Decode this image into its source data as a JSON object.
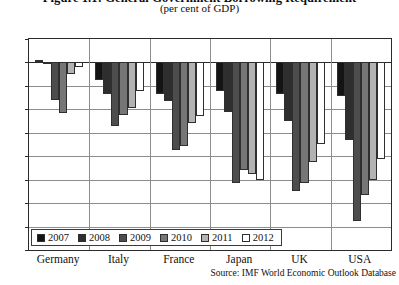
{
  "chart_data": {
    "type": "bar",
    "title": "Figure 1.1: General Government Borrowing Requirement",
    "subtitle": "(per cent of GDP)",
    "xlabel": "",
    "ylabel": "",
    "ylim": [
      -16,
      2
    ],
    "ytick_step": 2,
    "yticks": [
      2,
      0,
      -2,
      -4,
      -6,
      -8,
      -10,
      -12,
      -14,
      -16
    ],
    "ytick_labels": [
      "2",
      "0",
      "-2",
      "-4",
      "-6",
      "-8",
      "-10",
      "-12",
      "-14",
      "-16"
    ],
    "grid": true,
    "legend_position": "bottom-left-inside",
    "categories": [
      "Germany",
      "Italy",
      "France",
      "Japan",
      "UK",
      "USA"
    ],
    "series": [
      {
        "name": "2007",
        "color": "#141414",
        "values": [
          0.2,
          -1.5,
          -2.7,
          -2.4,
          -2.7,
          -2.9
        ]
      },
      {
        "name": "2008",
        "color": "#2e2e2e",
        "values": [
          -0.1,
          -2.7,
          -3.3,
          -4.2,
          -5.0,
          -6.6
        ]
      },
      {
        "name": "2009",
        "color": "#4d4d4d",
        "values": [
          -3.2,
          -5.4,
          -7.5,
          -10.3,
          -11.0,
          -13.5
        ]
      },
      {
        "name": "2010",
        "color": "#767676",
        "values": [
          -4.3,
          -4.5,
          -7.1,
          -9.2,
          -10.3,
          -11.3
        ]
      },
      {
        "name": "2011",
        "color": "#b3b3b3",
        "values": [
          -1.0,
          -3.9,
          -5.2,
          -9.5,
          -8.5,
          -10.0
        ]
      },
      {
        "name": "2012",
        "color": "#ffffff",
        "values": [
          -0.4,
          -2.4,
          -4.6,
          -10.0,
          -7.0,
          -8.2
        ]
      }
    ],
    "source": "Source: IMF World Economic Outlook Database"
  }
}
